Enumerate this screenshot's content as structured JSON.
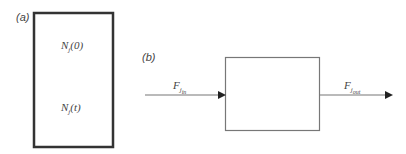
{
  "panel_a": {
    "label": "(a)",
    "top_text": {
      "symbol": "N",
      "subscript": "j",
      "arg": "(0)"
    },
    "bottom_text": {
      "symbol": "N",
      "subscript": "j",
      "arg": "(t)"
    }
  },
  "panel_b": {
    "label": "(b)",
    "inflow": {
      "symbol": "F",
      "subscript": "j",
      "subsubscript": "in"
    },
    "outflow": {
      "symbol": "F",
      "subscript": "j",
      "subsubscript": "out"
    }
  },
  "colors": {
    "box_a_border": "#333333",
    "box_b_border": "#777777",
    "arrow": "#666666"
  }
}
